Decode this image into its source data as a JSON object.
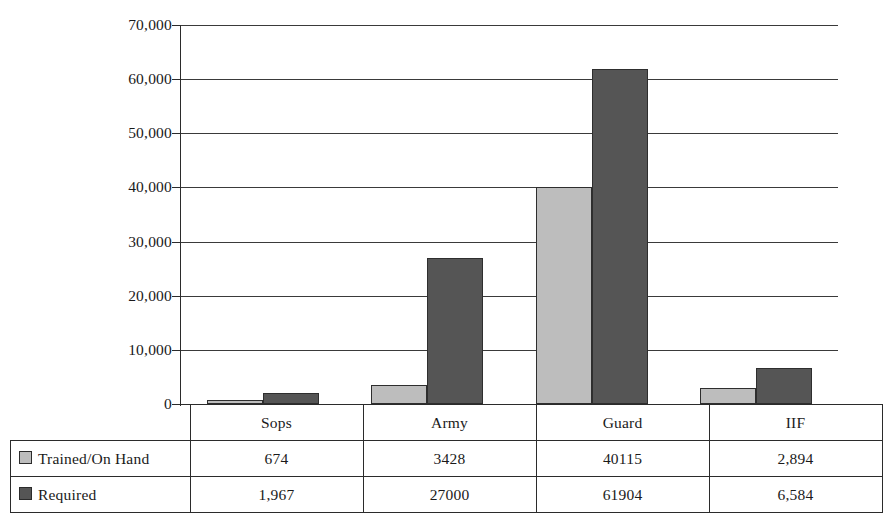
{
  "chart_data": {
    "type": "bar",
    "title": "",
    "xlabel": "",
    "ylabel": "",
    "categories": [
      "Sops",
      "Army",
      "Guard",
      "IIF"
    ],
    "series": [
      {
        "name": "Trained/On Hand",
        "color": "#bdbdbd",
        "values": [
          674,
          3428,
          40115,
          2894
        ],
        "labels": [
          "674",
          "3428",
          "40115",
          "2,894"
        ]
      },
      {
        "name": "Required",
        "color": "#555555",
        "values": [
          1967,
          27000,
          61904,
          6584
        ],
        "labels": [
          "1,967",
          "27000",
          "61904",
          "6,584"
        ]
      }
    ],
    "ylim": [
      0,
      70000
    ],
    "ytick_values": [
      0,
      10000,
      20000,
      30000,
      40000,
      50000,
      60000,
      70000
    ],
    "ytick_labels": [
      "0",
      "10,000",
      "20,000",
      "30,000",
      "40,000",
      "50,000",
      "60,000",
      "70,000"
    ],
    "grid": true,
    "legend_position": "bottom-table"
  },
  "table": {
    "category_headers": [
      "Sops",
      "Army",
      "Guard",
      "IIF"
    ],
    "rows": [
      {
        "label": "Trained/On Hand",
        "swatch": "#bdbdbd",
        "cells": [
          "674",
          "3428",
          "40115",
          "2,894"
        ]
      },
      {
        "label": "Required",
        "swatch": "#555555",
        "cells": [
          "1,967",
          "27000",
          "61904",
          "6,584"
        ]
      }
    ]
  }
}
